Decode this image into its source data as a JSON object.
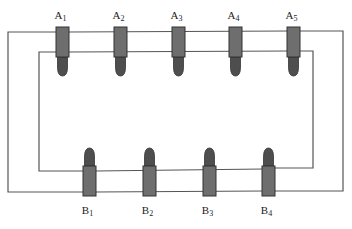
{
  "diagram": {
    "type": "series circuit with connectors",
    "colors": {
      "wire": "#555555",
      "connector_body": "#6e6e6e",
      "connector_tip": "#4e4e4e",
      "outline": "#333333",
      "background": "#ffffff"
    },
    "top_row": {
      "orientation": "tips pointing down",
      "connectors": [
        {
          "id": "A1",
          "letter": "A",
          "sub": "1",
          "x": 56
        },
        {
          "id": "A2",
          "letter": "A",
          "sub": "2",
          "x": 114
        },
        {
          "id": "A3",
          "letter": "A",
          "sub": "3",
          "x": 172
        },
        {
          "id": "A4",
          "letter": "A",
          "sub": "4",
          "x": 229
        },
        {
          "id": "A5",
          "letter": "A",
          "sub": "5",
          "x": 287
        }
      ]
    },
    "bottom_row": {
      "orientation": "tips pointing up",
      "connectors": [
        {
          "id": "B1",
          "letter": "B",
          "sub": "1",
          "x": 83
        },
        {
          "id": "B2",
          "letter": "B",
          "sub": "2",
          "x": 143
        },
        {
          "id": "B3",
          "letter": "B",
          "sub": "3",
          "x": 203
        },
        {
          "id": "B4",
          "letter": "B",
          "sub": "4",
          "x": 262
        }
      ]
    },
    "wires": [
      {
        "name": "outer-loop",
        "path": "top y=32, left x=8, bottom y=192, right x=343"
      },
      {
        "name": "inner-loop",
        "path": "top y=52, left x=39, bottom y=171, right x=313"
      }
    ]
  }
}
